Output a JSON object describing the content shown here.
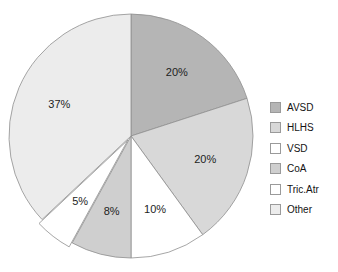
{
  "chart_data": {
    "type": "pie",
    "title": "",
    "subtitle": "",
    "xlabel": "",
    "ylabel": "",
    "legend_position": "right",
    "grid": false,
    "start_angle_deg": 0,
    "direction": "clockwise",
    "categories": [
      "AVSD",
      "HLHS",
      "VSD",
      "CoA",
      "Tric.Atr",
      "Other"
    ],
    "values": [
      20,
      20,
      10,
      8,
      5,
      37
    ],
    "value_unit": "%",
    "data_labels": [
      "20%",
      "20%",
      "10%",
      "8%",
      "5%",
      "37%"
    ],
    "colors": [
      "#b5b5b5",
      "#d8d8d8",
      "#ffffff",
      "#cfcfcf",
      "#ffffff",
      "#ececec"
    ],
    "slice_border_color": "#8f8f8f",
    "exploded": [
      false,
      false,
      false,
      false,
      true,
      false
    ],
    "slices": [
      {
        "label": "AVSD",
        "value": 20,
        "data_label": "20%",
        "color": "#b5b5b5",
        "exploded": false
      },
      {
        "label": "HLHS",
        "value": 20,
        "data_label": "20%",
        "color": "#d8d8d8",
        "exploded": false
      },
      {
        "label": "VSD",
        "value": 10,
        "data_label": "10%",
        "color": "#ffffff",
        "exploded": false
      },
      {
        "label": "CoA",
        "value": 8,
        "data_label": "8%",
        "color": "#cfcfcf",
        "exploded": false
      },
      {
        "label": "Tric.Atr",
        "value": 5,
        "data_label": "5%",
        "color": "#ffffff",
        "exploded": true
      },
      {
        "label": "Other",
        "value": 37,
        "data_label": "37%",
        "color": "#ececec",
        "exploded": false
      }
    ]
  },
  "legend": {
    "items": [
      {
        "label": "AVSD",
        "color": "#b5b5b5"
      },
      {
        "label": "HLHS",
        "color": "#d8d8d8"
      },
      {
        "label": "VSD",
        "color": "#ffffff"
      },
      {
        "label": "CoA",
        "color": "#cfcfcf"
      },
      {
        "label": "Tric.Atr",
        "color": "#ffffff"
      },
      {
        "label": "Other",
        "color": "#ececec"
      }
    ]
  },
  "style": {
    "background": "#ffffff",
    "label_text_color": "#1d1d1d",
    "legend_text_color": "#141414",
    "swatch_border_color": "#9a9a9a"
  },
  "geometry": {
    "center_x": 131,
    "center_y": 136,
    "radius": 122,
    "label_radius_ratio": 0.64,
    "explode_offset": 5
  }
}
